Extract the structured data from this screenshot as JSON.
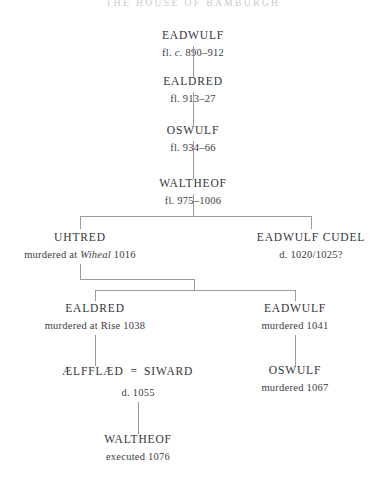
{
  "title": "THE HOUSE OF BAMBURGH",
  "nodes": {
    "eadwulf1": {
      "name": "EADWULF",
      "detail_pre": "fl. ",
      "detail_it": "c.",
      "detail_post": " 890–912"
    },
    "ealdred1": {
      "name": "EALDRED",
      "detail": "fl. 913–27"
    },
    "oswulf1": {
      "name": "OSWULF",
      "detail": "fl. 934–66"
    },
    "waltheof1": {
      "name": "WALTHEOF",
      "detail": "fl. 975–1006"
    },
    "uhtred": {
      "name": "UHTRED",
      "detail_pre": "murdered at ",
      "detail_it": "Wiheal",
      "detail_post": " 1016"
    },
    "cudel": {
      "name": "EADWULF CUDEL",
      "detail": "d. 1020/1025?"
    },
    "ealdred2": {
      "name": "EALDRED",
      "detail": "murdered at Rise 1038"
    },
    "eadwulf2": {
      "name": "EADWULF",
      "detail": "murdered 1041"
    },
    "aelfflaed": {
      "name": "ÆLFFLÆD"
    },
    "siward": {
      "name": "SIWARD",
      "detail": "d. 1055"
    },
    "marriage_symbol": "=",
    "oswulf2": {
      "name": "OSWULF",
      "detail": "murdered 1067"
    },
    "waltheof2": {
      "name": "WALTHEOF",
      "detail": "executed 1076"
    }
  },
  "colors": {
    "text": "#34343a",
    "line": "#9a9aa2",
    "title": "#c9c9cf",
    "background": "#ffffff"
  }
}
